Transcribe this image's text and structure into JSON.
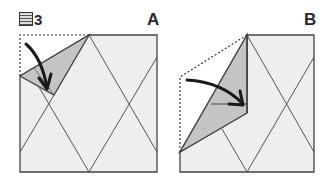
{
  "figure": {
    "title_number": "3",
    "panels": [
      {
        "id": "A",
        "label": "A",
        "description": "Square paper with diamond crease pattern; top-left corner folded down (shaded) along diagonal, arrow showing fold direction"
      },
      {
        "id": "B",
        "label": "B",
        "description": "Left side of square folded over along vertical center crease; shaded flap with arrow showing fold inward"
      }
    ]
  },
  "colors": {
    "paper": "#eeeeee",
    "flap": "#c4c4c4",
    "line": "#444444",
    "arrow": "#1a1a1a",
    "dashed": "#333333"
  }
}
